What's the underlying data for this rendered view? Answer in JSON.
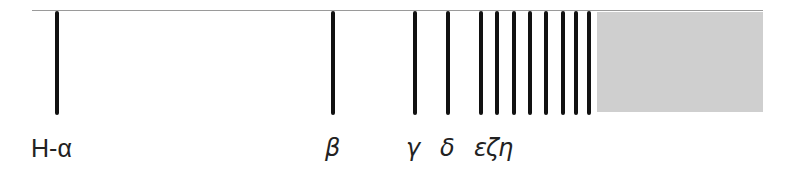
{
  "diagram": {
    "title": "",
    "lines": [
      {
        "x": 57,
        "label": "H-α"
      },
      {
        "x": 333,
        "label": "β"
      },
      {
        "x": 415,
        "label": "γ"
      },
      {
        "x": 448,
        "label": "δ"
      },
      {
        "x": 481,
        "label": "ε"
      },
      {
        "x": 497,
        "label": "ζ"
      },
      {
        "x": 514,
        "label": "η"
      },
      {
        "x": 530,
        "label": ""
      },
      {
        "x": 546,
        "label": ""
      },
      {
        "x": 563,
        "label": ""
      },
      {
        "x": 576,
        "label": ""
      },
      {
        "x": 589,
        "label": ""
      }
    ],
    "labels": {
      "alpha": "H-α",
      "beta": "β",
      "gamma": "γ",
      "delta": "δ",
      "epsilon_zeta_eta": "εζη"
    },
    "continuum_color": "#cfcfcf",
    "line_color": "#111111"
  }
}
